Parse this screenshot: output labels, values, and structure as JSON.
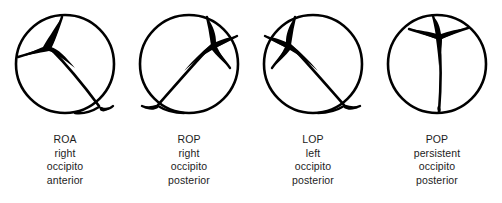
{
  "figure": {
    "background_color": "#ffffff",
    "line_color": "#000000",
    "fontanelle_fill": "#000000"
  },
  "panels": [
    {
      "id": "roa",
      "abbr": "ROA",
      "line1": "right",
      "line2": "occipito",
      "line3": "anterior",
      "anterior_fontanelle_position": "upper-left",
      "posterior_fontanelle_position": "lower-right"
    },
    {
      "id": "rop",
      "abbr": "ROP",
      "line1": "right",
      "line2": "occipito",
      "line3": "posterior",
      "anterior_fontanelle_position": "upper-right",
      "posterior_fontanelle_position": "lower-left"
    },
    {
      "id": "lop",
      "abbr": "LOP",
      "line1": "left",
      "line2": "occipito",
      "line3": "posterior",
      "anterior_fontanelle_position": "upper-left",
      "posterior_fontanelle_position": "lower-right"
    },
    {
      "id": "pop",
      "abbr": "POP",
      "line1": "persistent",
      "line2": "occipito",
      "line3": "posterior",
      "anterior_fontanelle_position": "top-center",
      "posterior_fontanelle_position": "bottom-center"
    }
  ]
}
